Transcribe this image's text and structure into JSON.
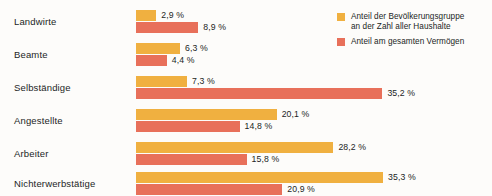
{
  "chart_data": {
    "type": "bar",
    "orientation": "horizontal",
    "title": "",
    "xlabel": "",
    "ylabel": "",
    "grid": false,
    "legend_position": "top-right",
    "xlim": [
      0,
      36
    ],
    "value_suffix": " %",
    "categories": [
      "Landwirte",
      "Beamte",
      "Selbständige",
      "Angestellte",
      "Arbeiter",
      "Nichterwerbstätige"
    ],
    "series": [
      {
        "name": "Anteil der Bevölkerungsgruppe an der Zahl aller Haushalte",
        "color": "#f0b040",
        "values": [
          2.9,
          6.3,
          7.3,
          20.1,
          28.2,
          35.3
        ],
        "labels": [
          "2,9 %",
          "6,3 %",
          "7,3 %",
          "20,1 %",
          "28,2 %",
          "35,3 %"
        ]
      },
      {
        "name": "Anteil am gesamten Vermögen",
        "color": "#e8705a",
        "values": [
          8.9,
          4.4,
          35.2,
          14.8,
          15.8,
          20.9
        ],
        "labels": [
          "8,9 %",
          "4,4 %",
          "35,2 %",
          "14,8 %",
          "15,8 %",
          "20,9 %"
        ]
      }
    ]
  },
  "legend": {
    "items": [
      {
        "line1": "Anteil der Bevölkerungsgruppe",
        "line2": "an der Zahl aller Haushalte"
      },
      {
        "line1": "Anteil am gesamten Vermögen",
        "line2": ""
      }
    ]
  },
  "colors": {
    "series_households": "#f0b040",
    "series_wealth": "#e8705a",
    "background": "#fdfcfa",
    "text": "#231f1e"
  }
}
